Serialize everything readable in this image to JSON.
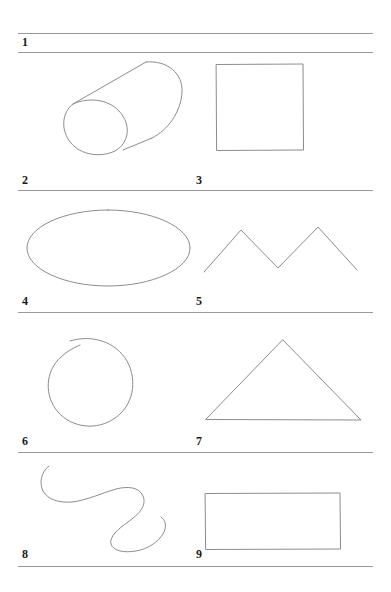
{
  "page": {
    "background": "#ffffff",
    "ink_color": "#8c8c8c",
    "rule_color": "#9a9a9a",
    "label_color": "#1a1a1a",
    "width": 391,
    "height": 592
  },
  "rules": [
    {
      "name": "rule-top",
      "x": 18,
      "y": 33,
      "width": 355
    },
    {
      "name": "rule-under-row-header",
      "x": 18,
      "y": 52,
      "width": 355
    },
    {
      "name": "rule-row-1",
      "x": 18,
      "y": 190,
      "width": 355
    },
    {
      "name": "rule-row-2",
      "x": 18,
      "y": 312,
      "width": 355
    },
    {
      "name": "rule-row-3",
      "x": 18,
      "y": 452,
      "width": 355
    },
    {
      "name": "rule-row-4",
      "x": 18,
      "y": 566,
      "width": 355
    }
  ],
  "labels": [
    {
      "name": "label-1",
      "text": "1",
      "x": 22,
      "y": 36
    },
    {
      "name": "label-2",
      "text": "2",
      "x": 22,
      "y": 174
    },
    {
      "name": "label-3",
      "text": "3",
      "x": 196,
      "y": 174
    },
    {
      "name": "label-4",
      "text": "4",
      "x": 22,
      "y": 295
    },
    {
      "name": "label-5",
      "text": "5",
      "x": 196,
      "y": 295
    },
    {
      "name": "label-6",
      "text": "6",
      "x": 22,
      "y": 435
    },
    {
      "name": "label-7",
      "text": "7",
      "x": 196,
      "y": 435
    },
    {
      "name": "label-8",
      "text": "8",
      "x": 22,
      "y": 548
    },
    {
      "name": "label-9",
      "text": "9",
      "x": 196,
      "y": 548
    }
  ],
  "shapes": [
    {
      "name": "cylinder-sketch",
      "label": "2",
      "type": "cylinder"
    },
    {
      "name": "square-sketch",
      "label": "3",
      "type": "square"
    },
    {
      "name": "ellipse-sketch",
      "label": "4",
      "type": "ellipse"
    },
    {
      "name": "zigzag-sketch",
      "label": "5",
      "type": "zigzag"
    },
    {
      "name": "circle-sketch",
      "label": "6",
      "type": "circle"
    },
    {
      "name": "triangle-sketch",
      "label": "7",
      "type": "triangle"
    },
    {
      "name": "squiggle-sketch",
      "label": "8",
      "type": "squiggle"
    },
    {
      "name": "rectangle-sketch",
      "label": "9",
      "type": "rectangle"
    }
  ]
}
